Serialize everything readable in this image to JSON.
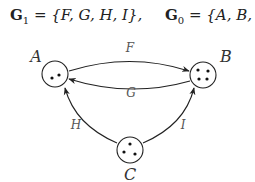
{
  "formulas": {
    "g1": {
      "symbol": "G",
      "subscript": "1",
      "equals": " = ",
      "set": "{F, G, H, I},",
      "full": "G1 = {F, G, H, I},"
    },
    "g0": {
      "symbol": "G",
      "subscript": "0",
      "equals": " = ",
      "set": "{A, B, C}",
      "full": "G0 = {A, B, C}"
    }
  },
  "nodes": [
    {
      "id": "A",
      "label": "A",
      "dots": 2
    },
    {
      "id": "B",
      "label": "B",
      "dots": 4
    },
    {
      "id": "C",
      "label": "C",
      "dots": 3
    }
  ],
  "edges": [
    {
      "id": "F",
      "label": "F",
      "from": "A",
      "to": "B"
    },
    {
      "id": "G",
      "label": "G",
      "from": "B",
      "to": "A"
    },
    {
      "id": "H",
      "label": "H",
      "from": "C",
      "to": "A"
    },
    {
      "id": "I",
      "label": "I",
      "from": "C",
      "to": "B"
    }
  ],
  "colors": {
    "stroke": "#222222",
    "text": "#333333",
    "edge_label": "#555555"
  }
}
